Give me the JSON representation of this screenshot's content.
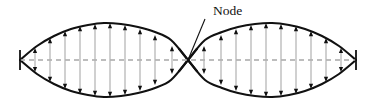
{
  "figure": {
    "title_label": "Node",
    "annotation": {
      "text": "Node",
      "text_x": 213,
      "text_y": 15,
      "leader_from_x": 205,
      "leader_from_y": 19,
      "leader_to_x": 188,
      "leader_to_y": 60
    },
    "colors": {
      "background": "#ffffff",
      "envelope": "#111111",
      "axis_dashed": "#a8a8a8",
      "arrow_stem": "#b4b4b4",
      "arrow_head": "#111111",
      "end_tick": "#111111",
      "label_text": "#111111"
    },
    "geometry": {
      "left_end_x": 20,
      "node_x": 188,
      "right_end_x": 356,
      "axis_y": 60,
      "max_amplitude": 37,
      "envelope_stroke_width": 2.1,
      "dash_pattern": "5 4"
    }
  },
  "chart_data": {
    "type": "line",
    "xlabel": "",
    "ylabel": "",
    "grid": false,
    "legend": null,
    "axis_ranges": {
      "x": [
        20,
        356
      ],
      "y": [
        -37,
        37
      ]
    },
    "annotations": [
      {
        "text": "Node",
        "points_to_x": 188,
        "points_to_y": 60,
        "label_x": 213,
        "label_y": 15
      }
    ],
    "series": [
      {
        "name": "upper envelope",
        "comment": "|A sin(2*pi*x/L)| positive lobe over each half",
        "x": [
          20,
          37,
          54,
          71,
          88,
          104,
          121,
          138,
          155,
          171,
          188,
          205,
          222,
          238,
          255,
          272,
          289,
          305,
          322,
          339,
          356
        ],
        "y": [
          0,
          14,
          24,
          31,
          35,
          37,
          36,
          33,
          28,
          20,
          0,
          20,
          28,
          33,
          36,
          37,
          35,
          31,
          24,
          14,
          0
        ]
      },
      {
        "name": "lower envelope",
        "comment": "mirror of upper envelope",
        "x": [
          20,
          37,
          54,
          71,
          88,
          104,
          121,
          138,
          155,
          171,
          188,
          205,
          222,
          238,
          255,
          272,
          289,
          305,
          322,
          339,
          356
        ],
        "y": [
          0,
          -14,
          -24,
          -31,
          -35,
          -37,
          -36,
          -33,
          -28,
          -20,
          0,
          -20,
          -28,
          -33,
          -36,
          -37,
          -35,
          -31,
          -24,
          -14,
          0
        ]
      },
      {
        "name": "equilibrium axis",
        "comment": "dashed horizontal center line",
        "x": [
          20,
          356
        ],
        "y": [
          0,
          0
        ]
      }
    ],
    "displacement_arrows": {
      "comment": "double-headed vertical arrows; half_length is amplitude at that x",
      "left_lobe": [
        {
          "x": 35,
          "half_length": 12
        },
        {
          "x": 50,
          "half_length": 22
        },
        {
          "x": 65,
          "half_length": 29
        },
        {
          "x": 80,
          "half_length": 34
        },
        {
          "x": 95,
          "half_length": 36
        },
        {
          "x": 110,
          "half_length": 37
        },
        {
          "x": 125,
          "half_length": 35
        },
        {
          "x": 140,
          "half_length": 31
        },
        {
          "x": 155,
          "half_length": 25
        },
        {
          "x": 172,
          "half_length": 14
        }
      ],
      "right_lobe": [
        {
          "x": 204,
          "half_length": 14
        },
        {
          "x": 221,
          "half_length": 25
        },
        {
          "x": 236,
          "half_length": 31
        },
        {
          "x": 251,
          "half_length": 35
        },
        {
          "x": 266,
          "half_length": 37
        },
        {
          "x": 281,
          "half_length": 36
        },
        {
          "x": 296,
          "half_length": 34
        },
        {
          "x": 311,
          "half_length": 29
        },
        {
          "x": 326,
          "half_length": 22
        },
        {
          "x": 341,
          "half_length": 12
        }
      ]
    },
    "end_ticks": [
      {
        "x": 20,
        "half_height": 10
      },
      {
        "x": 356,
        "half_height": 10
      }
    ]
  }
}
